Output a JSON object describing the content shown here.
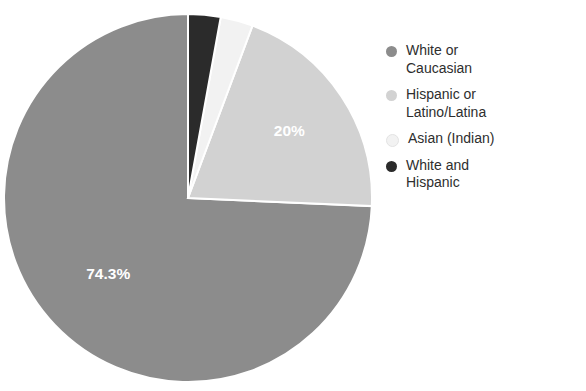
{
  "chart_data": {
    "type": "pie",
    "title": "",
    "subtitle": "",
    "xlabel": "",
    "ylabel": "",
    "legend_position": "right",
    "start_angle_deg": 90,
    "direction": "counterclockwise",
    "categories": [
      "White or Caucasian",
      "Hispanic or Latino/Latina",
      "Asian (Indian)",
      "White and Hispanic"
    ],
    "values": [
      74.3,
      20.0,
      2.85,
      2.85
    ],
    "value_unit": "%",
    "colors": [
      "#8c8c8c",
      "#d2d2d2",
      "#f2f2f2",
      "#2b2b2b"
    ],
    "slices": [
      {
        "label": "White or Caucasian",
        "value": 74.3,
        "display_label": "74.3%",
        "label_shown": true,
        "color": "#8c8c8c"
      },
      {
        "label": "Hispanic or Latino/Latina",
        "value": 20.0,
        "display_label": "20%",
        "label_shown": true,
        "color": "#d2d2d2"
      },
      {
        "label": "Asian (Indian)",
        "value": 2.85,
        "display_label": "",
        "label_shown": false,
        "color": "#f2f2f2"
      },
      {
        "label": "White and Hispanic",
        "value": 2.85,
        "display_label": "",
        "label_shown": false,
        "color": "#2b2b2b"
      }
    ],
    "data_labels": [
      "74.3%",
      "20%"
    ]
  },
  "legend": {
    "items": [
      {
        "label": "White or Caucasian",
        "color": "#8c8c8c"
      },
      {
        "label": "Hispanic or Latino/Latina",
        "color": "#d2d2d2"
      },
      {
        "label": "Asian (Indian)",
        "color": "#f2f2f2"
      },
      {
        "label": "White and Hispanic",
        "color": "#2b2b2b"
      }
    ]
  },
  "labels": {
    "major_slice": "74.3%",
    "second_slice": "20%"
  }
}
